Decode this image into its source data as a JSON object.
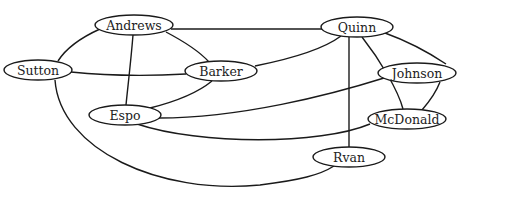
{
  "diagram": {
    "type": "undirected-graph",
    "colors": {
      "stroke": "#1a1a1a",
      "fill": "#ffffff",
      "text": "#222222"
    },
    "nodes": [
      {
        "id": "andrews",
        "label": "Andrews",
        "cx": 134,
        "cy": 25,
        "rx": 39,
        "ry": 10
      },
      {
        "id": "sutton",
        "label": "Sutton",
        "cx": 38,
        "cy": 70,
        "rx": 34,
        "ry": 10
      },
      {
        "id": "barker",
        "label": "Barker",
        "cx": 221,
        "cy": 71,
        "rx": 36,
        "ry": 10
      },
      {
        "id": "espo",
        "label": "Espo",
        "cx": 125,
        "cy": 115,
        "rx": 36,
        "ry": 10
      },
      {
        "id": "quinn",
        "label": "Quinn",
        "cx": 357,
        "cy": 27,
        "rx": 36,
        "ry": 10
      },
      {
        "id": "johnson",
        "label": "Johnson",
        "cx": 417,
        "cy": 73,
        "rx": 39,
        "ry": 10
      },
      {
        "id": "mcdonald",
        "label": "McDonald",
        "cx": 407,
        "cy": 119,
        "rx": 39,
        "ry": 10
      },
      {
        "id": "rvan",
        "label": "Rvan",
        "cx": 349,
        "cy": 157,
        "rx": 36,
        "ry": 10
      }
    ],
    "edges": [
      {
        "from": "andrews",
        "to": "quinn",
        "path": "M171,29 L322,29"
      },
      {
        "from": "andrews",
        "to": "sutton",
        "path": "M100,29 C80,38 65,50 58,61"
      },
      {
        "from": "andrews",
        "to": "barker",
        "path": "M166,32 C185,42 200,52 209,62"
      },
      {
        "from": "andrews",
        "to": "espo",
        "path": "M133,35 C131,60 128,85 126,105"
      },
      {
        "from": "sutton",
        "to": "barker",
        "path": "M71,72 C110,76 150,76 186,74"
      },
      {
        "from": "sutton",
        "to": "rvan",
        "path": "M55,80 C60,150 160,195 260,185 C300,180 320,175 334,166"
      },
      {
        "from": "barker",
        "to": "quinn",
        "path": "M255,66 C295,58 325,48 341,36"
      },
      {
        "from": "barker",
        "to": "espo",
        "path": "M212,81 C195,95 170,103 150,108"
      },
      {
        "from": "espo",
        "to": "johnson",
        "path": "M159,118 C240,118 330,95 384,78"
      },
      {
        "from": "espo",
        "to": "mcdonald",
        "path": "M137,124 C200,145 320,145 370,124"
      },
      {
        "from": "quinn",
        "to": "johnson",
        "path": "M385,33 C410,42 428,52 446,64"
      },
      {
        "from": "quinn",
        "to": "mcdonald",
        "path": "M362,37 C380,60 398,90 403,109"
      },
      {
        "from": "quinn",
        "to": "rvan",
        "path": "M349,37 L349,147"
      },
      {
        "from": "johnson",
        "to": "mcdonald",
        "path": "M440,82 C435,95 428,103 422,110"
      }
    ]
  }
}
